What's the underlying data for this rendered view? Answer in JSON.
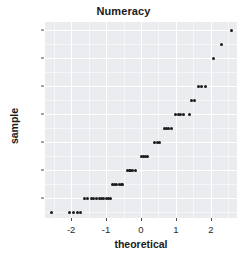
{
  "chart_data": {
    "type": "scatter",
    "title": "Numeracy",
    "xlabel": "theoretical",
    "ylabel": "sample",
    "xlim": [
      -2.75,
      2.75
    ],
    "ylim": [
      0.6,
      14.6
    ],
    "grid": true,
    "legend": null,
    "xticks": [
      -2,
      -1,
      0,
      1,
      2
    ],
    "xtick_labels": [
      "-2",
      "-1",
      "0",
      "1",
      "2"
    ],
    "yticks": [
      2,
      4,
      6,
      8,
      10,
      12,
      14
    ],
    "ytick_labels": [
      "2",
      "4",
      "6",
      "8",
      "10",
      "12",
      "14"
    ],
    "x_minor_ticks": [
      -2.5,
      -1.5,
      -0.5,
      0.5,
      1.5,
      2.5
    ],
    "y_minor_ticks": [
      1,
      3,
      5,
      7,
      9,
      11,
      13
    ],
    "point_color": "#1c1c1c",
    "panel_color": "#ebecf0",
    "gridline_color": "#ffffff",
    "points": [
      {
        "x": -2.57,
        "y": 1
      },
      {
        "x": -2.05,
        "y": 1
      },
      {
        "x": -1.92,
        "y": 1
      },
      {
        "x": -1.82,
        "y": 1
      },
      {
        "x": -1.73,
        "y": 1
      },
      {
        "x": -1.62,
        "y": 2
      },
      {
        "x": -1.52,
        "y": 2
      },
      {
        "x": -1.43,
        "y": 2
      },
      {
        "x": -1.35,
        "y": 2
      },
      {
        "x": -1.27,
        "y": 2
      },
      {
        "x": -1.2,
        "y": 2
      },
      {
        "x": -1.13,
        "y": 2
      },
      {
        "x": -1.06,
        "y": 2
      },
      {
        "x": -1.0,
        "y": 2
      },
      {
        "x": -0.93,
        "y": 2
      },
      {
        "x": -0.87,
        "y": 2
      },
      {
        "x": -0.81,
        "y": 3
      },
      {
        "x": -0.75,
        "y": 3
      },
      {
        "x": -0.69,
        "y": 3
      },
      {
        "x": -0.63,
        "y": 3
      },
      {
        "x": -0.57,
        "y": 3
      },
      {
        "x": -0.52,
        "y": 3
      },
      {
        "x": -0.4,
        "y": 4
      },
      {
        "x": -0.34,
        "y": 4
      },
      {
        "x": -0.29,
        "y": 4
      },
      {
        "x": -0.23,
        "y": 4
      },
      {
        "x": -0.17,
        "y": 4
      },
      {
        "x": 0.0,
        "y": 5
      },
      {
        "x": 0.06,
        "y": 5
      },
      {
        "x": 0.12,
        "y": 5
      },
      {
        "x": 0.18,
        "y": 5
      },
      {
        "x": 0.4,
        "y": 6
      },
      {
        "x": 0.46,
        "y": 6
      },
      {
        "x": 0.52,
        "y": 6
      },
      {
        "x": 0.66,
        "y": 7
      },
      {
        "x": 0.73,
        "y": 7
      },
      {
        "x": 0.79,
        "y": 7
      },
      {
        "x": 0.86,
        "y": 7
      },
      {
        "x": 1.0,
        "y": 8
      },
      {
        "x": 1.07,
        "y": 8
      },
      {
        "x": 1.14,
        "y": 8
      },
      {
        "x": 1.21,
        "y": 8
      },
      {
        "x": 1.38,
        "y": 8
      },
      {
        "x": 1.45,
        "y": 9
      },
      {
        "x": 1.53,
        "y": 9
      },
      {
        "x": 1.65,
        "y": 10
      },
      {
        "x": 1.72,
        "y": 10
      },
      {
        "x": 1.84,
        "y": 10
      },
      {
        "x": 2.08,
        "y": 12
      },
      {
        "x": 2.3,
        "y": 13
      },
      {
        "x": 2.6,
        "y": 14
      }
    ]
  }
}
